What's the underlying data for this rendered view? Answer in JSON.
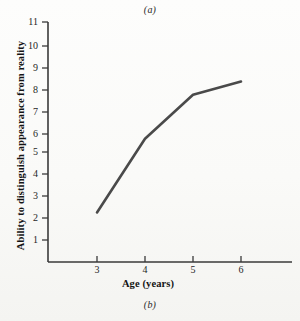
{
  "figure": {
    "top_label": "(a)",
    "bottom_label": "(b)"
  },
  "chart_data": {
    "type": "line",
    "title": "",
    "xlabel": "Age (years)",
    "ylabel": "Ability to distinguish appearance from reality",
    "x": [
      3,
      4,
      5,
      6
    ],
    "values": [
      2.25,
      5.6,
      7.6,
      8.2
    ],
    "xticks": [
      "3",
      "4",
      "5",
      "6"
    ],
    "yticks": [
      "1",
      "2",
      "3",
      "4",
      "5",
      "6",
      "7",
      "8",
      "9",
      "10",
      "11"
    ],
    "xlim": [
      2.0,
      7.1
    ],
    "ylim": [
      0,
      11
    ],
    "grid": false,
    "legend": null,
    "series": [
      {
        "name": "Ability to distinguish appearance from reality",
        "values": [
          2.25,
          5.6,
          7.6,
          8.2
        ]
      }
    ],
    "line_color": "#4a4a4a",
    "axis_color": "#3a3a3a"
  }
}
